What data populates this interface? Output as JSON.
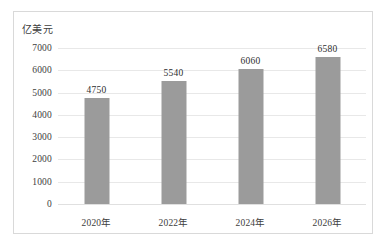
{
  "chart_data": {
    "type": "bar",
    "title": "",
    "subtitle": "",
    "xlabel": "",
    "ylabel": "亿美元",
    "unit_caption": "亿美元",
    "categories": [
      "2020年",
      "2022年",
      "2024年",
      "2026年"
    ],
    "values": [
      4750,
      5540,
      6060,
      6580
    ],
    "data_labels": [
      "4750",
      "5540",
      "6060",
      "6580"
    ],
    "ylim": [
      0,
      7000
    ],
    "ytick_values": [
      0,
      1000,
      2000,
      3000,
      4000,
      5000,
      6000,
      7000
    ],
    "ytick_labels": [
      "0",
      "1000",
      "2000",
      "3000",
      "4000",
      "5000",
      "6000",
      "7000"
    ],
    "grid": true,
    "legend": false,
    "legend_position": "none",
    "series": [
      {
        "name": "亿美元",
        "values": [
          4750,
          5540,
          6060,
          6580
        ]
      }
    ],
    "colors": {
      "bar": "#9b9b9b",
      "gridline": "#e8e8e8",
      "border": "#d9d9d9",
      "text": "#3d3d3d",
      "background": "#ffffff"
    }
  }
}
